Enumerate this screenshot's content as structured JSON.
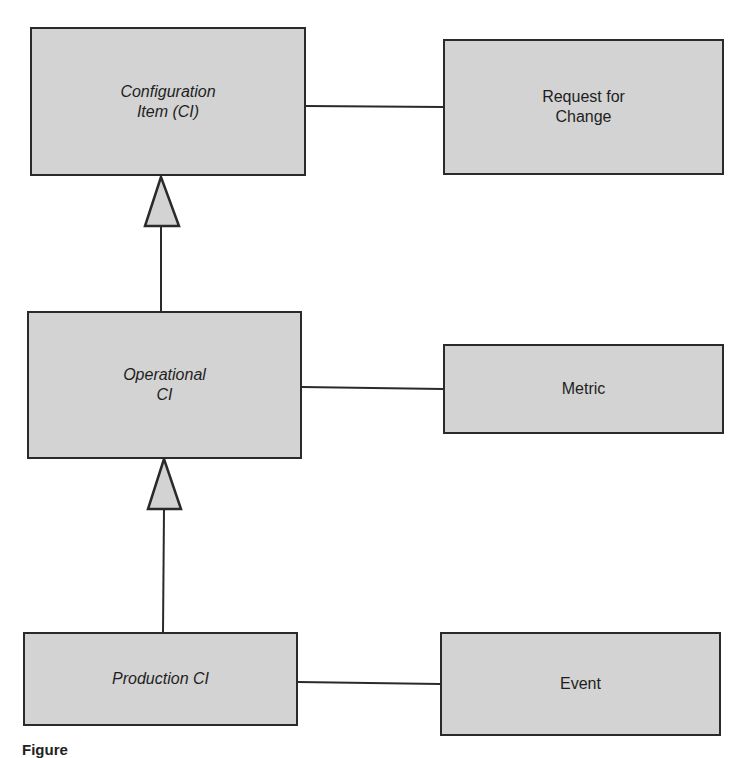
{
  "diagram": {
    "nodes": [
      {
        "id": "ci",
        "label": "Configuration\nItem (CI)",
        "italic": true
      },
      {
        "id": "rfc",
        "label": "Request for\nChange",
        "italic": false
      },
      {
        "id": "op",
        "label": "Operational\nCI",
        "italic": true
      },
      {
        "id": "met",
        "label": "Metric",
        "italic": false
      },
      {
        "id": "prod",
        "label": "Production CI",
        "italic": true
      },
      {
        "id": "evt",
        "label": "Event",
        "italic": false
      }
    ],
    "edges": [
      {
        "from": "ci",
        "to": "rfc",
        "type": "association"
      },
      {
        "from": "op",
        "to": "met",
        "type": "association"
      },
      {
        "from": "prod",
        "to": "evt",
        "type": "association"
      },
      {
        "from": "op",
        "to": "ci",
        "type": "generalization"
      },
      {
        "from": "prod",
        "to": "op",
        "type": "generalization"
      }
    ],
    "colors": {
      "box_fill": "#d3d3d3",
      "stroke": "#2a2a2a"
    }
  },
  "caption": "Figure"
}
